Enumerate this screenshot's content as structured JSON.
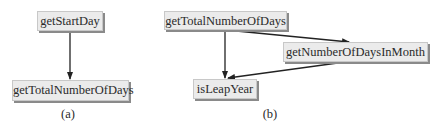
{
  "diagram_a": {
    "caption": "(a)",
    "nodes": [
      {
        "id": "getStartDay",
        "label": "getStartDay"
      },
      {
        "id": "getTotalNumberOfDays",
        "label": "getTotalNumberOfDays"
      }
    ],
    "edges": [
      {
        "from": "getStartDay",
        "to": "getTotalNumberOfDays"
      }
    ]
  },
  "diagram_b": {
    "caption": "(b)",
    "nodes": [
      {
        "id": "getTotalNumberOfDays",
        "label": "getTotalNumberOfDays"
      },
      {
        "id": "getNumberOfDaysInMonth",
        "label": "getNumberOfDaysInMonth"
      },
      {
        "id": "isLeapYear",
        "label": "isLeapYear"
      }
    ],
    "edges": [
      {
        "from": "getTotalNumberOfDays",
        "to": "getNumberOfDaysInMonth"
      },
      {
        "from": "getTotalNumberOfDays",
        "to": "isLeapYear"
      },
      {
        "from": "getNumberOfDaysInMonth",
        "to": "isLeapYear"
      }
    ]
  },
  "colors": {
    "node_fill": "#ebebeb",
    "node_shadow": "#8a8a8a",
    "edge": "#222222"
  }
}
